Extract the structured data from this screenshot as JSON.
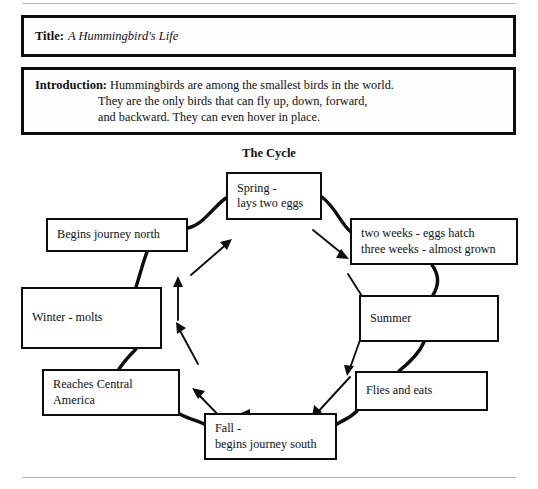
{
  "document": {
    "title_label": "Title:",
    "title_value": "A Hummingbird's Life",
    "introduction_label": "Introduction:",
    "introduction_lines": [
      "Hummingbirds are among the smallest birds in the world.",
      "They are the only birds that can fly up, down, forward,",
      "and backward. They can even hover in place."
    ]
  },
  "cycle": {
    "heading": "The Cycle",
    "nodes": [
      {
        "id": "spring",
        "lines": [
          "Spring -",
          "lays two eggs"
        ]
      },
      {
        "id": "twoweeks",
        "lines": [
          "two weeks - eggs hatch",
          "three weeks - almost grown"
        ]
      },
      {
        "id": "summer",
        "lines": [
          "Summer"
        ]
      },
      {
        "id": "flies",
        "lines": [
          "Flies and eats"
        ]
      },
      {
        "id": "fall",
        "lines": [
          "Fall -",
          "begins journey south"
        ]
      },
      {
        "id": "reaches",
        "lines": [
          "Reaches Central",
          "America"
        ]
      },
      {
        "id": "winter",
        "lines": [
          "Winter - molts"
        ]
      },
      {
        "id": "begins",
        "lines": [
          "Begins journey north"
        ]
      }
    ]
  },
  "colors": {
    "ink": "#0d0d0d",
    "paper": "#ffffff",
    "rule": "#b4b4b4"
  }
}
